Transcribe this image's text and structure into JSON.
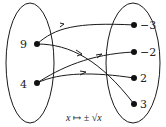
{
  "diagram": {
    "type": "mapping",
    "domain_set": {
      "elements": [
        "9",
        "4"
      ]
    },
    "codomain_set": {
      "elements": [
        "−3",
        "−2",
        "2",
        "3"
      ]
    },
    "mappings": [
      {
        "from": "9",
        "to": "−3"
      },
      {
        "from": "9",
        "to": "3"
      },
      {
        "from": "4",
        "to": "−2"
      },
      {
        "from": "4",
        "to": "2"
      }
    ],
    "caption": "x ↦ ± √x",
    "colors": {
      "stroke": "#1a1a1a",
      "background": "#ffffff"
    }
  }
}
